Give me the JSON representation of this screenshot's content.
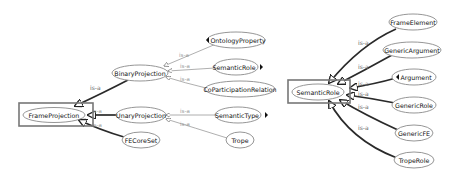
{
  "left_diagram": {
    "focus_node": "FrameProjection",
    "nodes": {
      "frame_projection": "FrameProjection",
      "binary_projection": "BinaryProjection",
      "unary_projection": "UnaryProjection",
      "fe_core_set": "FECoreSet",
      "ontology_property": "OntologyProperty",
      "semantic_role": "SemanticRole",
      "coparticipation_relation": "CoParticipationRelation",
      "semantic_type": "SemanticType",
      "trope": "Trope"
    },
    "edges": [
      {
        "from": "BinaryProjection",
        "to": "FrameProjection",
        "label": "is-a"
      },
      {
        "from": "UnaryProjection",
        "to": "FrameProjection",
        "label": "is-a"
      },
      {
        "from": "FECoreSet",
        "to": "FrameProjection",
        "label": "is-a"
      },
      {
        "from": "OntologyProperty",
        "to": "BinaryProjection",
        "label": "is-a"
      },
      {
        "from": "SemanticRole",
        "to": "BinaryProjection",
        "label": "is-a"
      },
      {
        "from": "CoParticipationRelation",
        "to": "BinaryProjection",
        "label": "is-a"
      },
      {
        "from": "SemanticType",
        "to": "UnaryProjection",
        "label": "is-a"
      },
      {
        "from": "Trope",
        "to": "UnaryProjection",
        "label": "is-a"
      }
    ]
  },
  "right_diagram": {
    "focus_node": "SemanticRole",
    "nodes": {
      "semantic_role": "SemanticRole",
      "frame_element": "FrameElement",
      "generic_argument": "GenericArgument",
      "argument": "Argument",
      "generic_role": "GenericRole",
      "generic_fe": "GenericFE",
      "trope_role": "TropeRole"
    },
    "edges": [
      {
        "from": "FrameElement",
        "to": "SemanticRole",
        "label": "is-a"
      },
      {
        "from": "GenericArgument",
        "to": "SemanticRole",
        "label": "is-a"
      },
      {
        "from": "Argument",
        "to": "SemanticRole",
        "label": "is-a"
      },
      {
        "from": "GenericRole",
        "to": "SemanticRole",
        "label": "is-a"
      },
      {
        "from": "GenericFE",
        "to": "SemanticRole",
        "label": "is-a"
      },
      {
        "from": "TropeRole",
        "to": "SemanticRole",
        "label": "is-a"
      }
    ]
  },
  "labels": {
    "is_a": "is-a"
  },
  "colors": {
    "node_stroke": "#8a8a8a",
    "focus_box": "#777777",
    "thick_edge": "#2a2a2a",
    "thin_edge": "#9a9a9a"
  }
}
